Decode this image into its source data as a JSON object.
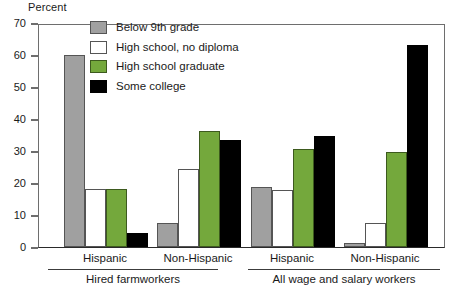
{
  "chart_data": {
    "type": "bar",
    "title": "",
    "ylabel": "Percent",
    "xlabel": "",
    "ylim": [
      0,
      70
    ],
    "ytick_step": 10,
    "yticks": [
      "70",
      "60",
      "50",
      "40",
      "30",
      "20",
      "10",
      "0"
    ],
    "grid": false,
    "legend_position": "top-center-left",
    "categories": [
      "Hispanic",
      "Non-Hispanic",
      "Hispanic",
      "Non-Hispanic"
    ],
    "group_labels": [
      "Hired farmworkers",
      "All wage and salary workers"
    ],
    "series": [
      {
        "name": "Below 9th grade",
        "color": "#a0a0a0",
        "swatch": "sw-gray",
        "values": [
          60.0,
          7.5,
          18.7,
          1.3
        ]
      },
      {
        "name": "High school, no diploma",
        "color": "#ffffff",
        "swatch": "sw-white",
        "values": [
          18.0,
          24.4,
          17.7,
          7.5
        ]
      },
      {
        "name": "High school graduate",
        "color": "#74a83c",
        "swatch": "sw-green",
        "values": [
          18.1,
          36.3,
          30.7,
          29.6
        ]
      },
      {
        "name": "Some college",
        "color": "#000000",
        "swatch": "sw-black",
        "values": [
          4.3,
          33.4,
          34.6,
          63.0
        ]
      }
    ],
    "groups": [
      {
        "label": "Hired farmworkers",
        "subgroups": [
          {
            "label": "Hispanic",
            "bars": [
              {
                "series": "Below 9th grade",
                "value": 60.0,
                "swatch": "sw-gray"
              },
              {
                "series": "High school, no diploma",
                "value": 18.0,
                "swatch": "sw-white"
              },
              {
                "series": "High school graduate",
                "value": 18.1,
                "swatch": "sw-green"
              },
              {
                "series": "Some college",
                "value": 4.3,
                "swatch": "sw-black"
              }
            ]
          },
          {
            "label": "Non-Hispanic",
            "bars": [
              {
                "series": "Below 9th grade",
                "value": 7.5,
                "swatch": "sw-gray"
              },
              {
                "series": "High school, no diploma",
                "value": 24.4,
                "swatch": "sw-white"
              },
              {
                "series": "High school graduate",
                "value": 36.3,
                "swatch": "sw-green"
              },
              {
                "series": "Some college",
                "value": 33.4,
                "swatch": "sw-black"
              }
            ]
          }
        ]
      },
      {
        "label": "All wage and salary workers",
        "subgroups": [
          {
            "label": "Hispanic",
            "bars": [
              {
                "series": "Below 9th grade",
                "value": 18.7,
                "swatch": "sw-gray"
              },
              {
                "series": "High school, no diploma",
                "value": 17.7,
                "swatch": "sw-white"
              },
              {
                "series": "High school graduate",
                "value": 30.7,
                "swatch": "sw-green"
              },
              {
                "series": "Some college",
                "value": 34.6,
                "swatch": "sw-black"
              }
            ]
          },
          {
            "label": "Non-Hispanic",
            "bars": [
              {
                "series": "Below 9th grade",
                "value": 1.3,
                "swatch": "sw-gray"
              },
              {
                "series": "High school, no diploma",
                "value": 7.5,
                "swatch": "sw-white"
              },
              {
                "series": "High school graduate",
                "value": 29.6,
                "swatch": "sw-green"
              },
              {
                "series": "Some college",
                "value": 63.0,
                "swatch": "sw-black"
              }
            ]
          }
        ]
      }
    ]
  },
  "legend": {
    "items": [
      {
        "label": "Below 9th grade",
        "swatch": "sw-gray"
      },
      {
        "label": "High school, no diploma",
        "swatch": "sw-white"
      },
      {
        "label": "High school graduate",
        "swatch": "sw-green"
      },
      {
        "label": "Some college",
        "swatch": "sw-black"
      }
    ]
  }
}
